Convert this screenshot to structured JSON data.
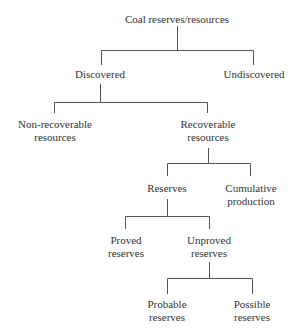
{
  "diagram": {
    "line_color": "#555555",
    "text_color": "#333333",
    "nodes": {
      "root": {
        "lines": [
          "Coal reserves/resources"
        ]
      },
      "discovered": {
        "lines": [
          "Discovered"
        ]
      },
      "undiscovered": {
        "lines": [
          "Undiscovered"
        ]
      },
      "non_recoverable": {
        "lines": [
          "Non-recoverable",
          "resources"
        ]
      },
      "recoverable": {
        "lines": [
          "Recoverable",
          "resources"
        ]
      },
      "reserves": {
        "lines": [
          "Reserves"
        ]
      },
      "cumulative": {
        "lines": [
          "Cumulative",
          "production"
        ]
      },
      "proved": {
        "lines": [
          "Proved",
          "reserves"
        ]
      },
      "unproved": {
        "lines": [
          "Unproved",
          "reserves"
        ]
      },
      "probable": {
        "lines": [
          "Probable",
          "reserves"
        ]
      },
      "possible": {
        "lines": [
          "Possible",
          "reserves"
        ]
      }
    },
    "edges": [
      [
        "root",
        "discovered"
      ],
      [
        "root",
        "undiscovered"
      ],
      [
        "discovered",
        "non_recoverable"
      ],
      [
        "discovered",
        "recoverable"
      ],
      [
        "recoverable",
        "reserves"
      ],
      [
        "recoverable",
        "cumulative"
      ],
      [
        "reserves",
        "proved"
      ],
      [
        "reserves",
        "unproved"
      ],
      [
        "unproved",
        "probable"
      ],
      [
        "unproved",
        "possible"
      ]
    ]
  }
}
